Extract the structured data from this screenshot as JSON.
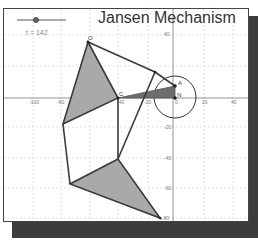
{
  "title": "Jansen Mechanism",
  "slider": {
    "label": "t = 142",
    "value": 142
  },
  "axes": {
    "x_ticks": [
      {
        "label": "-100",
        "x": 33
      },
      {
        "label": "-80",
        "x": 61
      },
      {
        "label": "-60",
        "x": 90
      },
      {
        "label": "-40",
        "x": 118
      },
      {
        "label": "-20",
        "x": 148
      },
      {
        "label": "0",
        "x": 176
      },
      {
        "label": "20",
        "x": 204
      },
      {
        "label": "40",
        "x": 233
      }
    ],
    "y_ticks": [
      {
        "label": "40",
        "y": 34
      },
      {
        "label": "-20",
        "y": 127
      },
      {
        "label": "-40",
        "y": 158
      },
      {
        "label": "-60",
        "y": 188
      },
      {
        "label": "-80",
        "y": 218
      }
    ]
  },
  "points": {
    "O": {
      "label": "O",
      "x": 88,
      "y": 42
    },
    "C": {
      "label": "C",
      "x": 118,
      "y": 98
    },
    "A": {
      "label": "A",
      "x": 175,
      "y": 86
    },
    "N": {
      "label": "N",
      "x": 175,
      "y": 98
    },
    "J": {
      "label": "",
      "x": 155,
      "y": 72
    },
    "L": {
      "label": "",
      "x": 63,
      "y": 124
    },
    "K": {
      "label": "",
      "x": 118,
      "y": 159
    },
    "F": {
      "label": "",
      "x": 70,
      "y": 184
    },
    "T": {
      "label": "",
      "x": 160,
      "y": 218
    }
  },
  "colors": {
    "fill": "#a9a9a9",
    "stroke": "#3a3a3a",
    "grid": "#cccccc",
    "shadow": "#3c3c3c"
  }
}
